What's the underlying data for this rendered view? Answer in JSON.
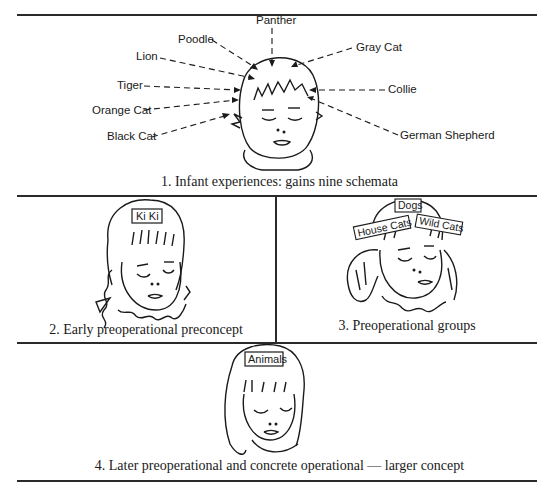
{
  "panel1": {
    "caption": "1. Infant experiences: gains nine schemata",
    "labels": {
      "panther": "Panther",
      "poodle": "Poodle",
      "lion": "Lion",
      "tiger": "Tiger",
      "orange_cat": "Orange Cat",
      "black_cat": "Black Cat",
      "gray_cat": "Gray Cat",
      "collie": "Collie",
      "german_shepherd": "German Shepherd"
    }
  },
  "panel2": {
    "caption": "2. Early preoperational preconcept",
    "tag": "Ki Ki"
  },
  "panel3": {
    "caption": "3. Preoperational groups",
    "tags": {
      "dogs": "Dogs",
      "house_cats": "House Cats",
      "wild_cats": "Wild Cats"
    }
  },
  "panel4": {
    "caption": "4. Later preoperational and concrete operational — larger concept",
    "tag": "Animals"
  }
}
